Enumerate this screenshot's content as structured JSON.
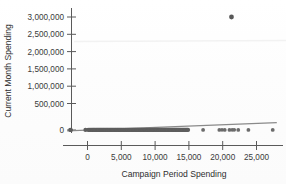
{
  "chart_data": {
    "type": "scatter",
    "title": "",
    "xlabel": "Campaign Period Spending",
    "ylabel": "Current Month Spending",
    "xlim": [
      -4000,
      28500
    ],
    "ylim": [
      -120000,
      3150000
    ],
    "xticks": [
      0,
      5000,
      10000,
      15000,
      20000,
      25000
    ],
    "xticklabels": [
      "0",
      "5,000",
      "10,000",
      "15,000",
      "20,000",
      "25,000"
    ],
    "yticks": [
      0,
      500000,
      1000000,
      1500000,
      2000000,
      2500000,
      3000000
    ],
    "yticklabels": [
      "0",
      "500,000",
      "1,000,000",
      "1,500,000",
      "2,000,000",
      "2,500,000",
      "3,000,000"
    ],
    "grid": false,
    "legend": null,
    "marker_color": "#6b6b6b",
    "fitline_color": "#8a8a8a",
    "axis_color": "#5a5a5a",
    "background_color": "#fefefe",
    "fitline": {
      "x_start": -3000,
      "y_start": -22000,
      "x_end": 28000,
      "y_end": 196000,
      "slope": 7.03,
      "intercept": -1910
    },
    "annotations": [
      {
        "label": "outlier",
        "x": 21300,
        "y": 3000000
      }
    ],
    "points": [
      [
        -2550,
        1000
      ],
      [
        -2450,
        500
      ],
      [
        -300,
        2000
      ],
      [
        100,
        1500
      ],
      [
        260,
        3000
      ],
      [
        420,
        1000
      ],
      [
        560,
        4000
      ],
      [
        700,
        2500
      ],
      [
        820,
        1200
      ],
      [
        940,
        5000
      ],
      [
        1050,
        800
      ],
      [
        1180,
        3500
      ],
      [
        1300,
        2000
      ],
      [
        1420,
        6000
      ],
      [
        1530,
        1500
      ],
      [
        1650,
        2800
      ],
      [
        1760,
        900
      ],
      [
        1880,
        4200
      ],
      [
        1990,
        1700
      ],
      [
        2100,
        3300
      ],
      [
        2220,
        2100
      ],
      [
        2340,
        5500
      ],
      [
        2450,
        1300
      ],
      [
        2570,
        2600
      ],
      [
        2690,
        3900
      ],
      [
        2800,
        1800
      ],
      [
        2920,
        4500
      ],
      [
        3030,
        2200
      ],
      [
        3150,
        1100
      ],
      [
        3270,
        3100
      ],
      [
        3380,
        5000
      ],
      [
        3500,
        1600
      ],
      [
        3610,
        2400
      ],
      [
        3730,
        3700
      ],
      [
        3850,
        1900
      ],
      [
        3960,
        4800
      ],
      [
        4080,
        2700
      ],
      [
        4190,
        1400
      ],
      [
        4310,
        3400
      ],
      [
        4430,
        2000
      ],
      [
        4540,
        5200
      ],
      [
        4660,
        1200
      ],
      [
        4770,
        2900
      ],
      [
        4890,
        4100
      ],
      [
        5010,
        1700
      ],
      [
        5120,
        3600
      ],
      [
        5240,
        2300
      ],
      [
        5350,
        4600
      ],
      [
        5470,
        1500
      ],
      [
        5590,
        2800
      ],
      [
        5700,
        3200
      ],
      [
        5820,
        1900
      ],
      [
        5930,
        5400
      ],
      [
        6050,
        2500
      ],
      [
        6170,
        1300
      ],
      [
        6280,
        3800
      ],
      [
        6400,
        2100
      ],
      [
        6510,
        4300
      ],
      [
        6630,
        1600
      ],
      [
        6750,
        2700
      ],
      [
        6860,
        3500
      ],
      [
        6980,
        2000
      ],
      [
        7090,
        4900
      ],
      [
        7210,
        1400
      ],
      [
        7330,
        3000
      ],
      [
        7440,
        2400
      ],
      [
        7560,
        5100
      ],
      [
        7670,
        1800
      ],
      [
        7790,
        3300
      ],
      [
        7910,
        2200
      ],
      [
        8020,
        4400
      ],
      [
        8140,
        1500
      ],
      [
        8250,
        2600
      ],
      [
        8370,
        3900
      ],
      [
        8490,
        2100
      ],
      [
        8600,
        4700
      ],
      [
        8720,
        1300
      ],
      [
        8830,
        3100
      ],
      [
        8950,
        2500
      ],
      [
        9070,
        5300
      ],
      [
        9180,
        1700
      ],
      [
        9300,
        2900
      ],
      [
        9410,
        3600
      ],
      [
        9530,
        2000
      ],
      [
        9650,
        4200
      ],
      [
        9760,
        1600
      ],
      [
        9880,
        2800
      ],
      [
        9990,
        3400
      ],
      [
        10110,
        2300
      ],
      [
        10230,
        4500
      ],
      [
        10340,
        1400
      ],
      [
        10460,
        3000
      ],
      [
        10570,
        2600
      ],
      [
        10690,
        5000
      ],
      [
        10810,
        1900
      ],
      [
        10920,
        3200
      ],
      [
        11040,
        2200
      ],
      [
        11150,
        4100
      ],
      [
        11270,
        1500
      ],
      [
        11390,
        2700
      ],
      [
        11500,
        3700
      ],
      [
        11620,
        2100
      ],
      [
        11730,
        4600
      ],
      [
        11850,
        1300
      ],
      [
        11970,
        3300
      ],
      [
        12080,
        2400
      ],
      [
        12200,
        5200
      ],
      [
        12310,
        1800
      ],
      [
        12430,
        2900
      ],
      [
        12550,
        3500
      ],
      [
        12660,
        2000
      ],
      [
        12780,
        4300
      ],
      [
        12890,
        1600
      ],
      [
        13010,
        3100
      ],
      [
        13130,
        2500
      ],
      [
        13240,
        4800
      ],
      [
        13360,
        1400
      ],
      [
        13470,
        2700
      ],
      [
        13590,
        3800
      ],
      [
        13710,
        2200
      ],
      [
        13820,
        4000
      ],
      [
        13940,
        1700
      ],
      [
        14050,
        3000
      ],
      [
        14170,
        2600
      ],
      [
        14290,
        4400
      ],
      [
        14400,
        1900
      ],
      [
        14520,
        3400
      ],
      [
        14630,
        2300
      ],
      [
        14750,
        3900
      ],
      [
        14870,
        2800
      ],
      [
        17100,
        3000
      ],
      [
        19500,
        2500
      ],
      [
        19900,
        4000
      ],
      [
        20300,
        3200
      ],
      [
        21000,
        2000
      ],
      [
        21400,
        5000
      ],
      [
        21700,
        3500
      ],
      [
        22300,
        2600
      ],
      [
        23800,
        3000
      ],
      [
        27400,
        2800
      ]
    ]
  }
}
